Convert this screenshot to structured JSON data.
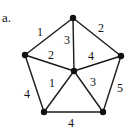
{
  "figure_label": "a.",
  "graph": {
    "nodes": [
      {
        "id": "top",
        "x": 73,
        "y": 18
      },
      {
        "id": "left",
        "x": 25,
        "y": 55
      },
      {
        "id": "right",
        "x": 121,
        "y": 56
      },
      {
        "id": "center",
        "x": 74,
        "y": 71
      },
      {
        "id": "bottom_left",
        "x": 44,
        "y": 112
      },
      {
        "id": "bottom_right",
        "x": 103,
        "y": 112
      }
    ],
    "edges": [
      {
        "from": "top",
        "to": "left",
        "weight": "1",
        "lx": 40,
        "ly": 36
      },
      {
        "from": "top",
        "to": "right",
        "weight": "2",
        "lx": 101,
        "ly": 32
      },
      {
        "from": "top",
        "to": "center",
        "weight": "3",
        "lx": 67,
        "ly": 44
      },
      {
        "from": "left",
        "to": "center",
        "weight": "2",
        "lx": 51,
        "ly": 59
      },
      {
        "from": "right",
        "to": "center",
        "weight": "4",
        "lx": 91,
        "ly": 60
      },
      {
        "from": "center",
        "to": "bottom_left",
        "weight": "1",
        "lx": 52,
        "ly": 87
      },
      {
        "from": "center",
        "to": "bottom_right",
        "weight": "3",
        "lx": 93,
        "ly": 86
      },
      {
        "from": "left",
        "to": "bottom_left",
        "weight": "4",
        "lx": 27,
        "ly": 98
      },
      {
        "from": "right",
        "to": "bottom_right",
        "weight": "5",
        "lx": 120,
        "ly": 92
      },
      {
        "from": "bottom_left",
        "to": "bottom_right",
        "weight": "4",
        "lx": 71,
        "ly": 127
      }
    ]
  }
}
